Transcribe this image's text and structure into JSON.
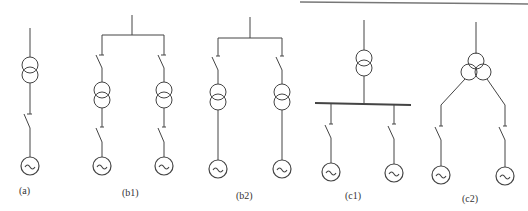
{
  "figure": {
    "type": "single-line wiring diagrams",
    "stroke_color": "#444444",
    "panels": [
      {
        "id": "a",
        "label": "(a)"
      },
      {
        "id": "b1",
        "label": "(b1)"
      },
      {
        "id": "b2",
        "label": "(b2)"
      },
      {
        "id": "c1",
        "label": "(c1)"
      },
      {
        "id": "c2",
        "label": "(c2)"
      }
    ],
    "generator_symbol": "~"
  }
}
